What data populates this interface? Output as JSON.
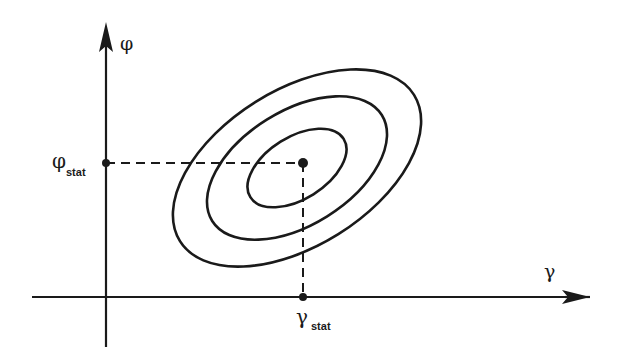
{
  "diagram": {
    "type": "contour-plot",
    "x_axis": {
      "label": "γ",
      "marker_label": "γ",
      "marker_subscript": "stat"
    },
    "y_axis": {
      "label": "φ",
      "marker_label": "φ",
      "marker_subscript": "stat"
    },
    "center_point": {
      "x_label": "γstat",
      "y_label": "φstat"
    },
    "contours": [
      {
        "name": "inner",
        "level": 1
      },
      {
        "name": "middle",
        "level": 2
      },
      {
        "name": "outer",
        "level": 3
      }
    ],
    "colors": {
      "stroke": "#1a1a1a",
      "background": "#ffffff"
    }
  }
}
